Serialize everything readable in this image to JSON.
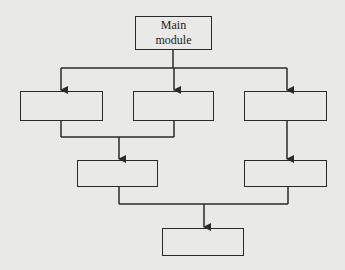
{
  "diagram": {
    "type": "module hierarchy chart",
    "main_module": {
      "label_line1": "Main",
      "label_line2": "module"
    },
    "modules": [
      {
        "id": "a",
        "label": ""
      },
      {
        "id": "b",
        "label": ""
      },
      {
        "id": "c",
        "label": ""
      },
      {
        "id": "d",
        "label": ""
      },
      {
        "id": "e",
        "label": ""
      },
      {
        "id": "f",
        "label": ""
      }
    ],
    "edges": [
      [
        "main",
        "a"
      ],
      [
        "main",
        "b"
      ],
      [
        "main",
        "c"
      ],
      [
        "a",
        "d"
      ],
      [
        "b",
        "d"
      ],
      [
        "c",
        "e"
      ],
      [
        "d",
        "f"
      ],
      [
        "e",
        "f"
      ]
    ],
    "colors": {
      "line": "#2a2a2a",
      "background": "#e9e9e7"
    }
  }
}
